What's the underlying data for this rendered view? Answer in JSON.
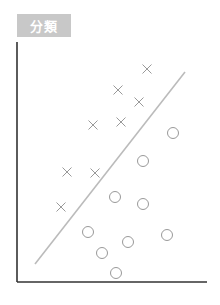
{
  "title": "分類",
  "colors": {
    "label_bg": "#c8c8c8",
    "label_text": "#ffffff",
    "axis": "#333333",
    "marker": "#999999",
    "boundary": "#bbbbbb"
  },
  "chart_data": {
    "type": "scatter",
    "title": "分類",
    "xlabel": "",
    "ylabel": "",
    "grid": false,
    "legend": null,
    "series": [
      {
        "name": "class-x",
        "marker": "×",
        "points": [
          [
            147,
            69
          ],
          [
            118,
            90
          ],
          [
            139,
            102
          ],
          [
            93,
            125
          ],
          [
            121,
            122
          ],
          [
            67,
            172
          ],
          [
            95,
            173
          ],
          [
            61,
            207
          ]
        ]
      },
      {
        "name": "class-o",
        "marker": "○",
        "points": [
          [
            173,
            133
          ],
          [
            143,
            161
          ],
          [
            115,
            197
          ],
          [
            143,
            204
          ],
          [
            88,
            232
          ],
          [
            128,
            242
          ],
          [
            167,
            235
          ],
          [
            102,
            253
          ],
          [
            116,
            273
          ]
        ]
      }
    ],
    "decision_boundary": {
      "from": [
        35,
        264
      ],
      "to": [
        185,
        72
      ]
    },
    "axes": {
      "origin": [
        17,
        282
      ],
      "x_end": [
        207,
        282
      ],
      "y_end": [
        17,
        42
      ]
    }
  }
}
